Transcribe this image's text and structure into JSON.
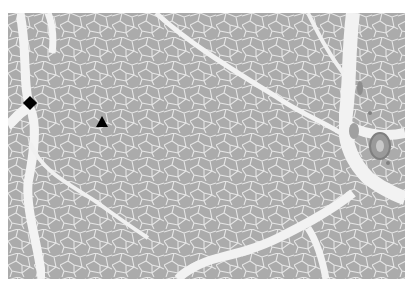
{
  "image": {
    "kind": "histology micrograph",
    "subject": "skeletal muscle cross-section (fascicles of polygonal fibers separated by connective tissue septa)",
    "background_color": "#ffffff",
    "fiber_color": "#ababab",
    "septum_color": "#f2f2f2",
    "vessel_color": "#8e8e8e"
  },
  "markers": [
    {
      "shape": "diamond",
      "symbol": "◆",
      "x": 30,
      "y": 104,
      "color": "#000000",
      "label": "diamond marker on perimysial septum"
    },
    {
      "shape": "triangle",
      "symbol": "▲",
      "x": 102,
      "y": 121,
      "color": "#000000",
      "label": "triangle marker on muscle fiber"
    }
  ]
}
